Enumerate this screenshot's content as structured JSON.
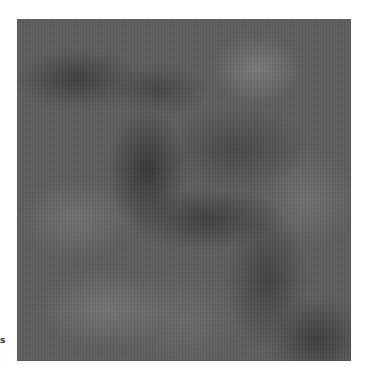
{
  "image": {
    "description": "Grayscale cloudy noise texture",
    "palette": {
      "dark": "#3a3a3a",
      "mid": "#5c5c5c",
      "light": "#757575",
      "background": "#ffffff"
    }
  },
  "margin_text": {
    "glyph": "s",
    "line2": "·",
    "line3": "·"
  }
}
